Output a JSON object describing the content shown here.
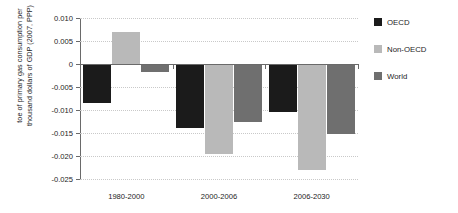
{
  "chart_data": {
    "type": "bar",
    "title": "",
    "xlabel": "",
    "ylabel": "toe of primary gas consumption per\nthousand dollars of GDP (2007, PPP)",
    "categories": [
      "1980-2000",
      "2000-2006",
      "2006-2030"
    ],
    "series": [
      {
        "name": "OECD",
        "color": "#1b1b1b",
        "values": [
          -0.0085,
          -0.014,
          -0.0105
        ]
      },
      {
        "name": "Non-OECD",
        "color": "#b9b9b9",
        "values": [
          0.007,
          -0.0195,
          -0.023
        ]
      },
      {
        "name": "World",
        "color": "#6f6f6f",
        "values": [
          -0.0018,
          -0.0127,
          -0.0152
        ]
      }
    ],
    "ylim": [
      -0.025,
      0.01
    ],
    "ytick_labels": [
      "0.010",
      "0.005",
      "0",
      "-0.005",
      "-0.010",
      "-0.015",
      "-0.020",
      "-0.025"
    ],
    "ytick_values": [
      0.01,
      0.005,
      0,
      -0.005,
      -0.01,
      -0.015,
      -0.02,
      -0.025
    ],
    "grid": true,
    "legend_position": "right"
  },
  "legend": {
    "items": [
      {
        "label": "OECD"
      },
      {
        "label": "Non-OECD"
      },
      {
        "label": "World"
      }
    ]
  },
  "axis": {
    "y_title": "toe of primary gas consumption per\nthousand dollars of GDP (2007, PPP)"
  }
}
